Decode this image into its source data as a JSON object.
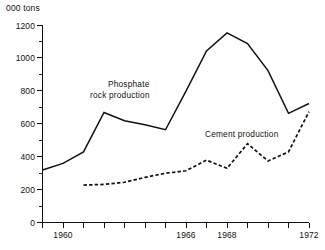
{
  "chart_data": {
    "type": "line",
    "title": "",
    "subtitle": "",
    "xlabel": "",
    "ylabel": "000 tons",
    "unit_label": "000 tons",
    "grid": false,
    "legend_position": "inline-annotation",
    "xlim": [
      1959,
      1972
    ],
    "ylim": [
      0,
      1200
    ],
    "x_tick_labels": [
      "1960",
      "1966",
      "1968",
      "1972"
    ],
    "x_tick_label_values": [
      1960,
      1966,
      1968,
      1972
    ],
    "x_all_ticks": [
      1959,
      1960,
      1961,
      1962,
      1963,
      1964,
      1965,
      1966,
      1967,
      1968,
      1969,
      1970,
      1971,
      1972
    ],
    "y_tick_labels": [
      "0",
      "200",
      "400",
      "600",
      "800",
      "1000",
      "1200"
    ],
    "y_tick_values": [
      0,
      200,
      400,
      600,
      800,
      1000,
      1200
    ],
    "y_minor_tick_values": [
      100,
      300,
      500,
      700,
      900,
      1100
    ],
    "series": [
      {
        "name": "Phosphate rock production",
        "style": "solid",
        "annotation": "Phosphate rock production",
        "annotation_line1": "Phosphate",
        "annotation_line2": "rock production",
        "x": [
          1959,
          1960,
          1961,
          1962,
          1963,
          1964,
          1965,
          1966,
          1967,
          1968,
          1969,
          1970,
          1971,
          1972
        ],
        "values": [
          320,
          360,
          430,
          670,
          620,
          595,
          565,
          800,
          1045,
          1155,
          1090,
          925,
          665,
          725
        ]
      },
      {
        "name": "Cement production",
        "style": "dashed",
        "annotation": "Cement production",
        "x": [
          1961,
          1962,
          1963,
          1964,
          1965,
          1966,
          1967,
          1968,
          1969,
          1970,
          1971,
          1972
        ],
        "values": [
          228,
          232,
          245,
          275,
          300,
          315,
          380,
          330,
          480,
          375,
          430,
          675
        ]
      }
    ],
    "annotations": [
      {
        "text": "Phosphate rock production",
        "x": 1963.2,
        "y": 960
      },
      {
        "text": "Cement production",
        "x": 1968.6,
        "y": 580
      }
    ],
    "colors": {
      "ink": "#111111",
      "background": "#ffffff"
    }
  }
}
